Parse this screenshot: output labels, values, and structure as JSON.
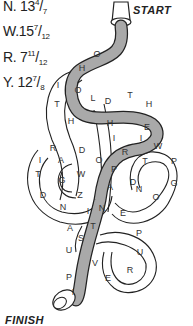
{
  "clues": [
    {
      "letter": "N.",
      "whole": "13",
      "num": "4",
      "den": "7"
    },
    {
      "letter": "W.",
      "whole": "15",
      "num": "7",
      "den": "12"
    },
    {
      "letter": "R.",
      "whole": "7",
      "num": "11",
      "den": "12"
    },
    {
      "letter": "Y.",
      "whole": "12",
      "num": "7",
      "den": "8"
    }
  ],
  "labels": {
    "start": "START",
    "finish": "FINISH"
  },
  "hose_letters_shaded": [
    "O",
    "H",
    "O",
    "L",
    "D",
    "T",
    "H",
    "E",
    "I",
    "R",
    "P",
    "A",
    "N",
    "T",
    "S",
    "U",
    "P",
    "I"
  ],
  "hose_letters_white": [
    "I",
    "T",
    "H",
    "H",
    "I",
    "R",
    "A",
    "D",
    "W",
    "G",
    "T",
    "D",
    "N",
    "I",
    "Z",
    "O",
    "P",
    "N",
    "D",
    "O",
    "G",
    "T",
    "W",
    "P",
    "E",
    "P",
    "U",
    "R",
    "E",
    "V",
    "A"
  ],
  "colors": {
    "hose_shaded": "#a9a9a9",
    "outline": "#222222",
    "background": "#ffffff"
  }
}
